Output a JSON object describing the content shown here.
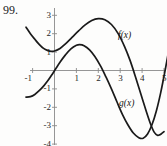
{
  "figure": {
    "problem_number": "99.",
    "background_color": "#fdfdfc",
    "curve_color": "#1a1a1a",
    "axis_color": "#8a8a8a",
    "text_color": "#1b1b1b"
  },
  "labels": {
    "f_label": "f(x)",
    "g_label": "g(x)"
  },
  "chart_data": {
    "type": "line",
    "title": "",
    "xlabel": "",
    "ylabel": "",
    "grid": false,
    "legend": "inline-annotations",
    "xlim": [
      -1.35,
      5.25
    ],
    "ylim": [
      -4.3,
      3.35
    ],
    "xticks": [
      -1,
      1,
      2,
      3,
      4,
      5
    ],
    "xtick_labels": [
      "-1",
      "1",
      "2",
      "3",
      "4",
      "5"
    ],
    "yticks": [
      3,
      2,
      1,
      -1,
      -2,
      -3,
      -4
    ],
    "ytick_labels": [
      "3",
      "2",
      "1",
      "-1",
      "-2",
      "-3",
      "-4"
    ],
    "series": [
      {
        "name": "f(x)",
        "color": "#1a1a1a",
        "annotation": "f(x)",
        "annotation_at": [
          2.9,
          2.15
        ],
        "points": [
          [
            -1.3,
            2.35
          ],
          [
            -1.1,
            2.0
          ],
          [
            -0.9,
            1.7
          ],
          [
            -0.7,
            1.42
          ],
          [
            -0.5,
            1.2
          ],
          [
            -0.3,
            1.08
          ],
          [
            -0.15,
            1.04
          ],
          [
            0.0,
            1.06
          ],
          [
            0.25,
            1.2
          ],
          [
            0.5,
            1.45
          ],
          [
            0.8,
            1.8
          ],
          [
            1.1,
            2.15
          ],
          [
            1.4,
            2.48
          ],
          [
            1.7,
            2.72
          ],
          [
            2.0,
            2.82
          ],
          [
            2.3,
            2.76
          ],
          [
            2.6,
            2.5
          ],
          [
            2.9,
            2.02
          ],
          [
            3.2,
            1.3
          ],
          [
            3.45,
            0.55
          ],
          [
            3.7,
            -0.35
          ],
          [
            3.95,
            -1.3
          ],
          [
            4.2,
            -2.25
          ],
          [
            4.4,
            -2.95
          ],
          [
            4.55,
            -3.35
          ],
          [
            4.7,
            -3.52
          ],
          [
            4.8,
            -3.5
          ],
          [
            4.9,
            -3.42
          ],
          [
            5.0,
            -3.32
          ]
        ]
      },
      {
        "name": "g(x)",
        "color": "#1a1a1a",
        "annotation": "g(x)",
        "annotation_at": [
          2.95,
          -1.55
        ],
        "points": [
          [
            -1.3,
            -1.45
          ],
          [
            -1.1,
            -1.42
          ],
          [
            -0.9,
            -1.3
          ],
          [
            -0.7,
            -1.1
          ],
          [
            -0.5,
            -0.85
          ],
          [
            -0.3,
            -0.55
          ],
          [
            -0.1,
            -0.2
          ],
          [
            0.05,
            0.08
          ],
          [
            0.25,
            0.45
          ],
          [
            0.5,
            0.85
          ],
          [
            0.75,
            1.18
          ],
          [
            1.0,
            1.37
          ],
          [
            1.15,
            1.41
          ],
          [
            1.35,
            1.35
          ],
          [
            1.6,
            1.12
          ],
          [
            1.85,
            0.75
          ],
          [
            2.1,
            0.25
          ],
          [
            2.35,
            -0.35
          ],
          [
            2.6,
            -1.0
          ],
          [
            2.85,
            -1.7
          ],
          [
            3.1,
            -2.38
          ],
          [
            3.35,
            -2.95
          ],
          [
            3.6,
            -3.4
          ],
          [
            3.85,
            -3.65
          ],
          [
            4.05,
            -3.68
          ],
          [
            4.25,
            -3.45
          ],
          [
            4.45,
            -2.95
          ],
          [
            4.65,
            -2.2
          ],
          [
            4.85,
            -1.2
          ],
          [
            5.05,
            0.0
          ],
          [
            5.2,
            1.0
          ],
          [
            5.25,
            1.6
          ]
        ]
      }
    ],
    "intersections": [
      [
        0.1,
        0.15
      ],
      [
        4.25,
        -3.5
      ]
    ]
  }
}
